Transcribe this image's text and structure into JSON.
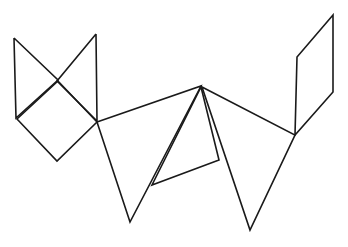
{
  "canvas": {
    "width": 348,
    "height": 247,
    "background_color": "#ffffff",
    "description": "Abstract black line drawing of an unfolded polygonal wireframe figure on a plain white background"
  },
  "style": {
    "stroke_color": "#1a1a1a",
    "stroke_width": 1.6,
    "fill": "none"
  },
  "shapes": [
    {
      "name": "left-bowtie-upper-left-triangle",
      "type": "polygon",
      "closed": false,
      "points": "14,38 16,118 58,80 14,38"
    },
    {
      "name": "left-bowtie-upper-right-triangle",
      "type": "polygon",
      "closed": false,
      "points": "96,34 97,121 57,81 96,34"
    },
    {
      "name": "left-diamond",
      "type": "polygon",
      "closed": true,
      "points": "17,119 57,161 97,122 58,81"
    },
    {
      "name": "center-left-large-triangle",
      "type": "polygon",
      "closed": true,
      "points": "97,122 201,86 130,222"
    },
    {
      "name": "center-inner-quadrilateral",
      "type": "polygon",
      "closed": true,
      "points": "201,87 219,160 152,185"
    },
    {
      "name": "center-right-large-triangle",
      "type": "polygon",
      "closed": true,
      "points": "202,87 295,135 250,230"
    },
    {
      "name": "right-parallelogram",
      "type": "polygon",
      "closed": true,
      "points": "333,15 297,57 295,135 333,92"
    }
  ]
}
